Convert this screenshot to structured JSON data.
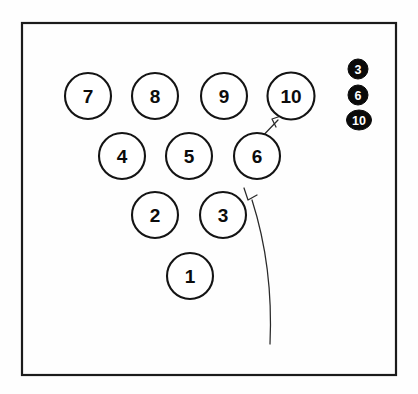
{
  "figure": {
    "background_color": "#fefefe",
    "frame": {
      "name": "outer-border",
      "x": 22,
      "y": 23,
      "width": 374,
      "height": 352,
      "stroke_color": "#1b1b1b"
    },
    "node_style": {
      "fill": "#ffffff",
      "stroke": "#141414",
      "radius": 23
    },
    "badge_style": {
      "fill": "#0a0a0a",
      "text_color": "#ffffff"
    }
  },
  "nodes": [
    {
      "label": "7",
      "cx": 88,
      "cy": 96,
      "r": 23,
      "rx": 23,
      "row": 4
    },
    {
      "label": "8",
      "cx": 155,
      "cy": 96,
      "r": 23,
      "rx": 23,
      "row": 4
    },
    {
      "label": "9",
      "cx": 224,
      "cy": 96,
      "r": 23,
      "rx": 23,
      "row": 4
    },
    {
      "label": "10",
      "cx": 291,
      "cy": 96,
      "r": 23.5,
      "rx": 23.5,
      "row": 4
    },
    {
      "label": "4",
      "cx": 122,
      "cy": 156,
      "r": 23,
      "rx": 23,
      "row": 3
    },
    {
      "label": "5",
      "cx": 189,
      "cy": 156,
      "r": 23,
      "rx": 23,
      "row": 3
    },
    {
      "label": "6",
      "cx": 257,
      "cy": 156,
      "r": 23,
      "rx": 23,
      "row": 3
    },
    {
      "label": "2",
      "cx": 155,
      "cy": 215,
      "r": 23,
      "rx": 23,
      "row": 2
    },
    {
      "label": "3",
      "cx": 223,
      "cy": 215,
      "r": 23,
      "rx": 23,
      "row": 2
    },
    {
      "label": "1",
      "cx": 190,
      "cy": 276,
      "r": 23,
      "rx": 23,
      "row": 1
    }
  ],
  "badges": [
    {
      "label": "3",
      "cx": 358,
      "cy": 69,
      "rx": 10,
      "ry": 10
    },
    {
      "label": "6",
      "cx": 358,
      "cy": 95,
      "rx": 10,
      "ry": 10
    },
    {
      "label": "10",
      "cx": 359,
      "cy": 120,
      "rx": 12.5,
      "ry": 10
    }
  ],
  "arrows": [
    {
      "name": "long-curved-arrow-to-node-6",
      "path": "M 270 344 C 272 300 268 250 252 200",
      "head": "M 244 188 L 248 200 L 257 195",
      "from_label": "",
      "to_label": "6"
    },
    {
      "name": "short-arrow-node-6-to-node-10",
      "path": "M 256 143 L 278 120",
      "head": "M 281 116 L 272 119 L 276 127",
      "from_label": "6",
      "to_label": "10"
    }
  ]
}
